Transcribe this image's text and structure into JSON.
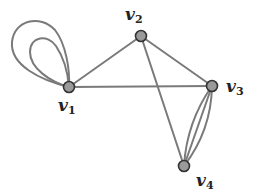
{
  "graph": {
    "vertices": [
      {
        "id": "v1",
        "label": "v",
        "subscript": "1"
      },
      {
        "id": "v2",
        "label": "v",
        "subscript": "2"
      },
      {
        "id": "v3",
        "label": "v",
        "subscript": "3"
      },
      {
        "id": "v4",
        "label": "v",
        "subscript": "4"
      }
    ],
    "edges": [
      {
        "from": "v1",
        "to": "v1",
        "type": "loop"
      },
      {
        "from": "v1",
        "to": "v1",
        "type": "loop"
      },
      {
        "from": "v1",
        "to": "v2",
        "type": "straight"
      },
      {
        "from": "v1",
        "to": "v3",
        "type": "straight"
      },
      {
        "from": "v2",
        "to": "v3",
        "type": "straight"
      },
      {
        "from": "v2",
        "to": "v4",
        "type": "straight"
      },
      {
        "from": "v3",
        "to": "v4",
        "type": "straight"
      },
      {
        "from": "v3",
        "to": "v4",
        "type": "curved"
      },
      {
        "from": "v3",
        "to": "v4",
        "type": "curved"
      }
    ],
    "colors": {
      "edge": "#7a7a7a",
      "node_fill": "#9a9a9a",
      "node_stroke": "#333333",
      "label": "#222222"
    }
  }
}
